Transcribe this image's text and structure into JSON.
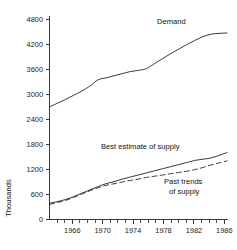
{
  "chart_data": {
    "type": "line",
    "title": "",
    "subtitle": "",
    "xlabel": "",
    "ylabel": "Thousands",
    "xlim": [
      1964,
      1986
    ],
    "ylim": [
      0,
      4800
    ],
    "grid": false,
    "legend_position": "inline-annotations",
    "y_ticks": [
      0,
      600,
      1200,
      1800,
      2400,
      3000,
      3600,
      4200,
      4800
    ],
    "y_tick_labels": [
      "0",
      "600",
      "1200",
      "1800",
      "2400",
      "3000",
      "3600",
      "4200",
      "4800"
    ],
    "x_ticks": [
      1966,
      1970,
      1974,
      1978,
      1982,
      1986
    ],
    "x_tick_labels": [
      "1966",
      "1970",
      "1974",
      "1978",
      "1982",
      "1986"
    ],
    "x_minor_ticks": [
      1964,
      1965,
      1967,
      1968,
      1969,
      1971,
      1972,
      1973,
      1975,
      1976,
      1977,
      1979,
      1980,
      1981,
      1983,
      1984,
      1985
    ],
    "series": [
      {
        "name": "Demand",
        "style": "solid",
        "color": "#222222",
        "label_text": "Demand",
        "x": [
          1964,
          1965,
          1966,
          1967,
          1968,
          1969,
          1970,
          1971,
          1972,
          1973,
          1974,
          1975,
          1976,
          1977,
          1978,
          1979,
          1980,
          1981,
          1982,
          1983,
          1984,
          1985,
          1986
        ],
        "values": [
          2700,
          2790,
          2880,
          2980,
          3080,
          3200,
          3350,
          3400,
          3450,
          3500,
          3550,
          3580,
          3620,
          3740,
          3860,
          3980,
          4090,
          4200,
          4300,
          4390,
          4450,
          4470,
          4480
        ]
      },
      {
        "name": "Best estimate of supply",
        "style": "solid",
        "color": "#222222",
        "label_text": "Best estimate of supply",
        "x": [
          1964,
          1965,
          1966,
          1967,
          1968,
          1969,
          1970,
          1971,
          1972,
          1973,
          1974,
          1975,
          1976,
          1977,
          1978,
          1979,
          1980,
          1981,
          1982,
          1983,
          1984,
          1985,
          1986
        ],
        "values": [
          380,
          420,
          470,
          540,
          620,
          700,
          780,
          850,
          900,
          960,
          1010,
          1060,
          1110,
          1160,
          1210,
          1260,
          1310,
          1360,
          1410,
          1440,
          1470,
          1530,
          1600
        ]
      },
      {
        "name": "Past trends of supply",
        "style": "dashed",
        "color": "#222222",
        "label_text": "Past trends\nof supply",
        "x": [
          1964,
          1965,
          1966,
          1967,
          1968,
          1969,
          1970,
          1971,
          1972,
          1973,
          1974,
          1975,
          1976,
          1977,
          1978,
          1979,
          1980,
          1981,
          1982,
          1983,
          1984,
          1985,
          1986
        ],
        "values": [
          350,
          400,
          450,
          520,
          600,
          680,
          750,
          810,
          850,
          890,
          930,
          960,
          1000,
          1030,
          1060,
          1090,
          1120,
          1150,
          1190,
          1240,
          1300,
          1350,
          1400
        ]
      }
    ],
    "annotations": [
      {
        "text": "Demand",
        "x_px": 157,
        "y_px": 24
      },
      {
        "text": "Best estimate of supply",
        "x_px": 101,
        "y_px": 149
      },
      {
        "text": "Past trends",
        "x_px": 164,
        "y_px": 184
      },
      {
        "text": "of supply",
        "x_px": 169,
        "y_px": 194
      }
    ]
  },
  "axis": {
    "y_title": "Thousands"
  }
}
